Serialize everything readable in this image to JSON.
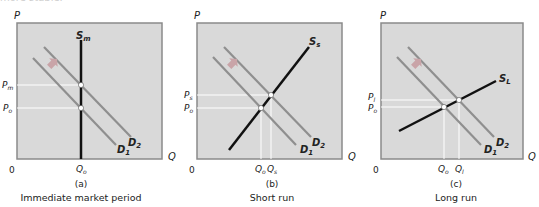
{
  "header_fragment": "more stable.",
  "colors": {
    "panel_fill": "#d9d9d9",
    "panel_border": "#8a8a8a",
    "supply": "#111111",
    "demand": "#8f8f8f",
    "guide": "#ffffff",
    "arrow": "#c9a4a8"
  },
  "panels": [
    {
      "id": "a",
      "letter": "(a)",
      "caption": "Immediate market period",
      "axis_y": "P",
      "axis_x": "Q",
      "origin": "0",
      "supply_label": "S",
      "supply_sub": "m",
      "d1_label": "D",
      "d1_sub": "1",
      "d2_label": "D",
      "d2_sub": "2",
      "price_labels": [
        {
          "main": "P",
          "sub": "m"
        },
        {
          "main": "P",
          "sub": "o"
        }
      ],
      "qty_labels": [
        {
          "main": "Q",
          "sub": "o"
        }
      ]
    },
    {
      "id": "b",
      "letter": "(b)",
      "caption": "Short run",
      "axis_y": "P",
      "axis_x": "Q",
      "origin": "0",
      "supply_label": "S",
      "supply_sub": "s",
      "d1_label": "D",
      "d1_sub": "1",
      "d2_label": "D",
      "d2_sub": "2",
      "price_labels": [
        {
          "main": "P",
          "sub": "s"
        },
        {
          "main": "P",
          "sub": "o"
        }
      ],
      "qty_labels": [
        {
          "main": "Q",
          "sub": "o"
        },
        {
          "main": "Q",
          "sub": "s"
        }
      ]
    },
    {
      "id": "c",
      "letter": "(c)",
      "caption": "Long run",
      "axis_y": "P",
      "axis_x": "Q",
      "origin": "0",
      "supply_label": "S",
      "supply_sub": "L",
      "d1_label": "D",
      "d1_sub": "1",
      "d2_label": "D",
      "d2_sub": "2",
      "price_labels": [
        {
          "main": "P",
          "sub": "l"
        },
        {
          "main": "P",
          "sub": "o"
        }
      ],
      "qty_labels": [
        {
          "main": "Q",
          "sub": "o"
        },
        {
          "main": "Q",
          "sub": "l"
        }
      ]
    }
  ]
}
